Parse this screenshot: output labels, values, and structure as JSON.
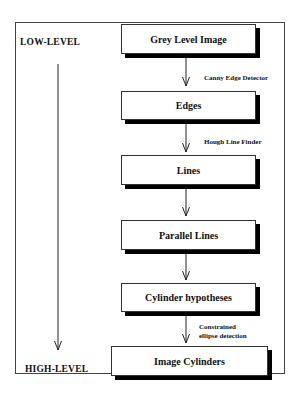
{
  "diagram": {
    "type": "flowchart",
    "levels": {
      "top": "LOW-LEVEL",
      "bottom": "HIGH-LEVEL"
    },
    "nodes": [
      {
        "id": "grey",
        "label": "Grey Level Image"
      },
      {
        "id": "edges",
        "label": "Edges"
      },
      {
        "id": "lines",
        "label": "Lines"
      },
      {
        "id": "parallel",
        "label": "Parallel Lines"
      },
      {
        "id": "cyl_hyp",
        "label": "Cylinder hypotheses"
      },
      {
        "id": "image_cyl",
        "label": "Image Cylinders"
      }
    ],
    "edges": [
      {
        "from": "grey",
        "to": "edges",
        "label": "Canny Edge Detector"
      },
      {
        "from": "edges",
        "to": "lines",
        "label": "Hough Line Finder"
      },
      {
        "from": "lines",
        "to": "parallel",
        "label": ""
      },
      {
        "from": "parallel",
        "to": "cyl_hyp",
        "label": ""
      },
      {
        "from": "cyl_hyp",
        "to": "image_cyl",
        "label_line1": "Constrained",
        "label_line2": "ellipse detection"
      }
    ]
  }
}
